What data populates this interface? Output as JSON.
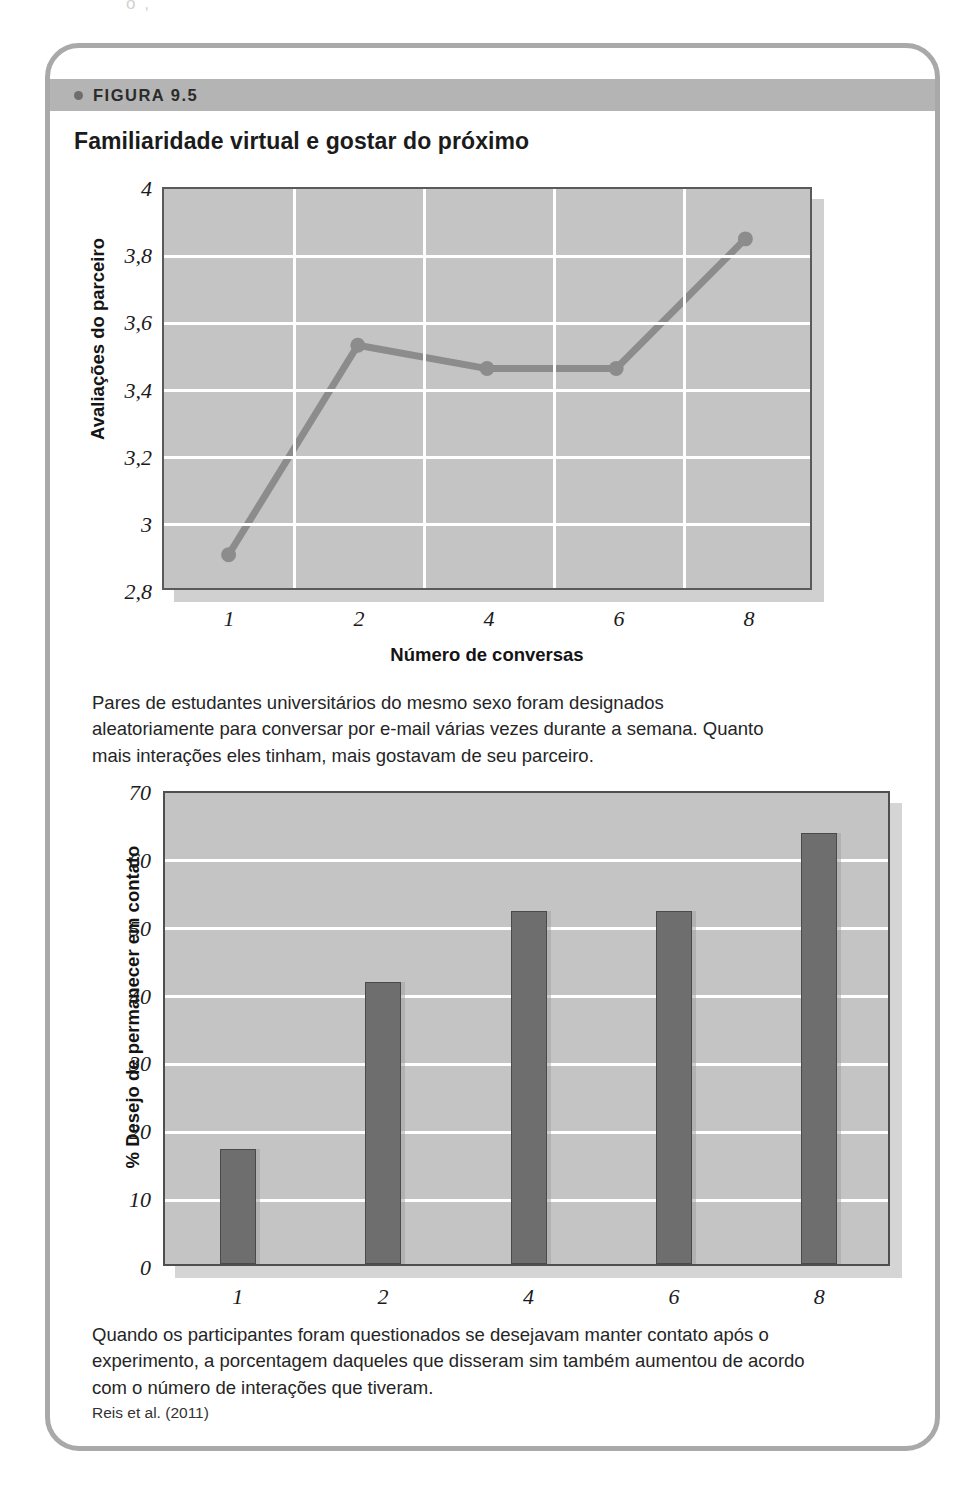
{
  "page": {
    "top_fragment": "o    ,"
  },
  "figure": {
    "header_label": "FIGURA 9.5",
    "header_bullet_icon": "bullet-dot-icon",
    "source": "Reis et al. (2011)"
  },
  "captions": {
    "caption1": "Pares de estudantes universitários do mesmo sexo foram designados aleatoriamente para conversar por e-mail várias vezes durante a semana. Quanto mais interações eles tinham, mais gostavam de seu parceiro.",
    "caption2": "Quando os participantes foram questionados se desejavam manter contato após o experimento, a porcentagem daqueles que disseram sim também aumentou de acordo com o número de interações que tiveram."
  },
  "chart_data": [
    {
      "type": "line",
      "title": "Familiaridade virtual e gostar do próximo",
      "xlabel": "Número de conversas",
      "ylabel": "Avaliações do parceiro",
      "categories": [
        "1",
        "2",
        "4",
        "6",
        "8"
      ],
      "values": [
        2.9,
        3.53,
        3.46,
        3.46,
        3.85
      ],
      "yticks": [
        "2,8",
        "3",
        "3,2",
        "3,4",
        "3,6",
        "3,8",
        "4"
      ],
      "ytick_values": [
        2.8,
        3.0,
        3.2,
        3.4,
        3.6,
        3.8,
        4.0
      ],
      "ylim": [
        2.8,
        4.0
      ],
      "grid": true,
      "legend": "none",
      "plot_bg": "#c4c4c4",
      "grid_color": "#ffffff",
      "line_color": "#8c8c8c",
      "marker": "circle"
    },
    {
      "type": "bar",
      "title": "",
      "xlabel": "",
      "ylabel": "% Desejo de permanecer em contato",
      "categories": [
        "1",
        "2",
        "4",
        "6",
        "8"
      ],
      "values": [
        17,
        41.5,
        52,
        52,
        63.5
      ],
      "yticks": [
        "0",
        "10",
        "20",
        "30",
        "40",
        "50",
        "60",
        "70"
      ],
      "ytick_values": [
        0,
        10,
        20,
        30,
        40,
        50,
        60,
        70
      ],
      "ylim": [
        0,
        70
      ],
      "grid": true,
      "legend": "none",
      "plot_bg": "#c4c4c4",
      "grid_color": "#ffffff",
      "bar_color": "#6e6e6e"
    }
  ]
}
